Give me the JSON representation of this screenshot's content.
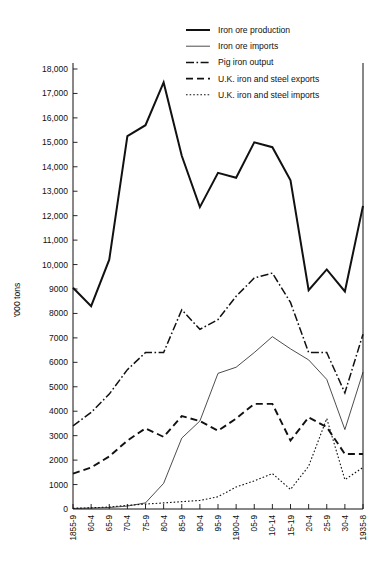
{
  "chart_data": {
    "type": "line",
    "title": "",
    "xlabel": "",
    "ylabel": "'000 tons",
    "ylim": [
      0,
      18000
    ],
    "grid": false,
    "legend_position": "top-right",
    "y_ticks": [
      "0",
      "1000",
      "2000",
      "3000",
      "4000",
      "5000",
      "6000",
      "7000",
      "8000",
      "9000",
      "10,000",
      "11,000",
      "12,000",
      "13,000",
      "14,000",
      "15,000",
      "16,000",
      "17,000",
      "18,000"
    ],
    "categories": [
      "1855-9",
      "60-4",
      "65-9",
      "70-4",
      "75-9",
      "80-4",
      "85-9",
      "90-4",
      "95-9",
      "1900-4",
      "05-9",
      "10-14",
      "15-19",
      "20-4",
      "25-9",
      "30-4",
      "1935-8"
    ],
    "series": [
      {
        "name": "Iron ore production",
        "style": "solid-thick",
        "values": [
          9050,
          8300,
          10200,
          15250,
          15700,
          17450,
          14450,
          12350,
          13750,
          13550,
          15000,
          14800,
          13450,
          8950,
          9800,
          8900,
          12400
        ]
      },
      {
        "name": "Iron ore imports",
        "style": "solid-thin",
        "values": [
          20,
          40,
          60,
          120,
          250,
          1050,
          2900,
          3600,
          5550,
          5800,
          6400,
          7050,
          6550,
          6100,
          5300,
          3250,
          5600
        ]
      },
      {
        "name": "Pig iron output",
        "style": "dash-dot",
        "values": [
          3400,
          3950,
          4700,
          5700,
          6400,
          6400,
          8150,
          7350,
          7750,
          8700,
          9450,
          9650,
          8450,
          6400,
          6400,
          4750,
          7150
        ]
      },
      {
        "name": "U.K. iron and steel exports",
        "style": "dashed",
        "values": [
          1450,
          1700,
          2150,
          2800,
          3300,
          2950,
          3800,
          3600,
          3200,
          3700,
          4300,
          4300,
          2800,
          3750,
          3350,
          2250,
          2250
        ]
      },
      {
        "name": "U.K. iron and steel imports",
        "style": "dotted",
        "values": [
          30,
          50,
          80,
          150,
          200,
          250,
          300,
          350,
          500,
          900,
          1150,
          1450,
          800,
          1750,
          3700,
          1200,
          1700
        ]
      }
    ]
  },
  "legend": {
    "items": [
      {
        "label": "Iron ore production",
        "swatch": "solid-thick"
      },
      {
        "label": "Iron ore imports",
        "swatch": "solid-thin"
      },
      {
        "label": "Pig iron output",
        "swatch": "dash-dot"
      },
      {
        "label": "U.K. iron and steel exports",
        "swatch": "dashed"
      },
      {
        "label": "U.K. iron and steel imports",
        "swatch": "dotted"
      }
    ]
  }
}
